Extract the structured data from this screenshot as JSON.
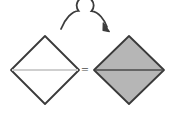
{
  "figure": {
    "background_color": "#ffffff",
    "equals_label": "=",
    "colors": {
      "outline": "#3a3a3a",
      "white_fill": "#ffffff",
      "gray_fill": "#b6b6b6",
      "light_midline": "#cfcfcf",
      "dark_midline": "#4a4a4a",
      "arrow": "#3c3c3c",
      "equals": "#4a4a4a"
    },
    "arrow": {
      "name": "flip-rotation-arrow",
      "description": "curved arc with circular loop and arrowhead pointing right",
      "loop_center_x": 85,
      "loop_center_y": 17,
      "loop_radius": 8.5,
      "arc_start_x": 61,
      "arc_start_y": 29,
      "arc_end_x": 108,
      "arc_end_y": 30,
      "stroke_width": 1.8
    },
    "shapes": [
      {
        "name": "left-diamond",
        "label": "white diamond with light midline",
        "fill": "#ffffff",
        "stroke": "#3a3a3a",
        "stroke_width": 1.8,
        "center_x": 45,
        "center_y": 70,
        "half_width": 34,
        "half_height": 34,
        "points": "45,36 79,70 45,104 11,70",
        "midline": {
          "name": "left-diamond-midline",
          "x1": 12,
          "y1": 70,
          "x2": 78,
          "y2": 70,
          "color": "#cfcfcf",
          "width": 2.2
        }
      },
      {
        "name": "right-diamond",
        "label": "gray filled diamond with dark midline",
        "fill": "#b6b6b6",
        "stroke": "#3a3a3a",
        "stroke_width": 1.8,
        "center_x": 129,
        "center_y": 70,
        "half_width": 35,
        "half_height": 34,
        "points": "129,36 164,70 129,104 94,70",
        "midline": {
          "name": "right-diamond-midline",
          "x1": 95,
          "y1": 70,
          "x2": 163,
          "y2": 70,
          "color": "#4a4a4a",
          "width": 1.4
        }
      }
    ]
  }
}
